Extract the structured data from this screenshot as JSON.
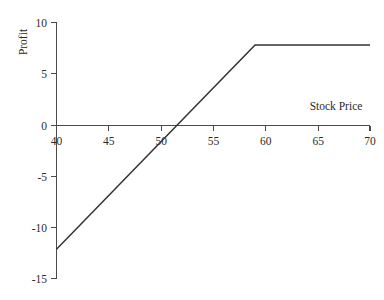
{
  "chart_data": {
    "type": "line",
    "title": "",
    "subtitle": "",
    "xlabel": "Stock Price",
    "ylabel": "Profit",
    "xlim": [
      40,
      70
    ],
    "ylim": [
      -15,
      10
    ],
    "grid": false,
    "legend": null,
    "xticks": [
      40,
      45,
      50,
      55,
      60,
      65,
      70
    ],
    "xtick_labels": [
      "40",
      "45",
      "50",
      "55",
      "60",
      "65",
      "70"
    ],
    "yticks": [
      10,
      5,
      0,
      -5,
      -10,
      -15
    ],
    "ytick_labels": [
      "10",
      "5",
      "0",
      "-5",
      "-10",
      "-15"
    ],
    "series": [
      {
        "name": "Profit",
        "x": [
          40,
          51.6,
          59,
          70
        ],
        "values": [
          -12.2,
          0,
          7.75,
          7.75
        ]
      }
    ],
    "annotations": []
  },
  "axes": {
    "y_title": "Profit",
    "x_title": "Stock Price",
    "y_tick_0": "10",
    "y_tick_1": "5",
    "y_tick_2": "0",
    "y_tick_3": "-5",
    "y_tick_4": "-10",
    "y_tick_5": "-15",
    "x_tick_0": "40",
    "x_tick_1": "45",
    "x_tick_2": "50",
    "x_tick_3": "55",
    "x_tick_4": "60",
    "x_tick_5": "65",
    "x_tick_6": "70"
  },
  "colors": {
    "background": "#ffffff",
    "axis": "#4a4a4a",
    "series": "#333333",
    "text": "#2b2b2b"
  }
}
